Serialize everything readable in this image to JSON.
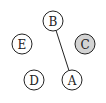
{
  "graph": {
    "nodes": [
      {
        "id": "A",
        "label": "A",
        "cx": 72,
        "cy": 80,
        "fill": "#ffffff"
      },
      {
        "id": "B",
        "label": "B",
        "cx": 53,
        "cy": 21,
        "fill": "#ffffff"
      },
      {
        "id": "C",
        "label": "C",
        "cx": 85,
        "cy": 44,
        "fill": "#d3d3d3"
      },
      {
        "id": "D",
        "label": "D",
        "cx": 34,
        "cy": 80,
        "fill": "#ffffff"
      },
      {
        "id": "E",
        "label": "E",
        "cx": 22,
        "cy": 44,
        "fill": "#ffffff"
      }
    ],
    "edges": [
      {
        "from": "B",
        "to": "A"
      }
    ],
    "node_radius": 10,
    "stroke_color": "#222222",
    "highlight_color": "#d3d3d3"
  }
}
